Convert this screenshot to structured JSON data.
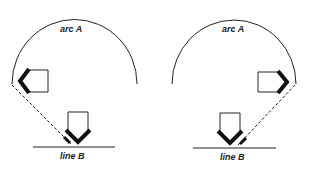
{
  "diagrams": [
    {
      "id": "left",
      "arc_label": "arc A",
      "line_label": "line B",
      "side_shape_direction": "left",
      "bottom_shape_direction": "down"
    },
    {
      "id": "right",
      "arc_label": "arc A",
      "line_label": "line B",
      "side_shape_direction": "right",
      "bottom_shape_direction": "down"
    }
  ],
  "colors": {
    "stroke": "#222222",
    "background": "#ffffff"
  }
}
